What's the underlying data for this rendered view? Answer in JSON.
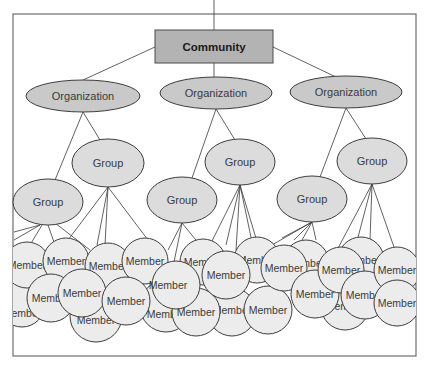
{
  "diagram": {
    "root": {
      "label": "Community"
    },
    "organizations": [
      {
        "label": "Organization"
      },
      {
        "label": "Organization"
      },
      {
        "label": "Organization"
      }
    ],
    "groups": [
      {
        "label": "Group"
      },
      {
        "label": "Group"
      },
      {
        "label": "Group"
      },
      {
        "label": "Group"
      },
      {
        "label": "Group"
      },
      {
        "label": "Group"
      }
    ],
    "member_label": "Member",
    "colors": {
      "community_fill": "#b3b3b3",
      "organization_fill": "#c9c9c9",
      "group_fill": "#dcdcdc",
      "member_fill": "#ececec",
      "stroke": "#3d3d3d"
    }
  }
}
